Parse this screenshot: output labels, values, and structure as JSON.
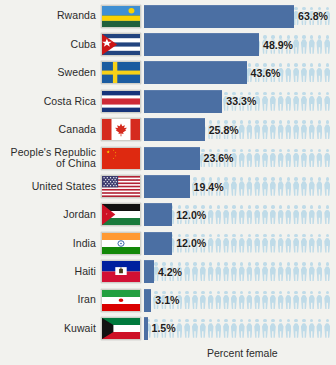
{
  "chart_data": {
    "type": "bar",
    "title": "",
    "xlabel": "Percent female",
    "ylabel": "",
    "orientation": "horizontal",
    "xlim": [
      0,
      63.8
    ],
    "grid": false,
    "legend": false,
    "categories": [
      "Rwanda",
      "Cuba",
      "Sweden",
      "Costa Rica",
      "Canada",
      "People's Republic of China",
      "United States",
      "Jordan",
      "India",
      "Haiti",
      "Iran",
      "Kuwait"
    ],
    "values": [
      63.8,
      48.9,
      43.6,
      33.3,
      25.8,
      23.6,
      19.4,
      12.0,
      12.0,
      4.2,
      3.1,
      1.5
    ],
    "value_labels": [
      "63.8%",
      "48.9%",
      "43.6%",
      "33.3%",
      "25.8%",
      "23.6%",
      "19.4%",
      "12.0%",
      "12.0%",
      "4.2%",
      "3.1%",
      "1.5%"
    ],
    "bar_color": "#4b6fa3",
    "background_icon_color": "#bfdbe8"
  },
  "axis": {
    "caption": "Percent female"
  },
  "rows": [
    {
      "country": "Rwanda",
      "value_label": "63.8%",
      "flag": "rwanda-flag",
      "lines": [
        "Rwanda"
      ]
    },
    {
      "country": "Cuba",
      "value_label": "48.9%",
      "flag": "cuba-flag",
      "lines": [
        "Cuba"
      ]
    },
    {
      "country": "Sweden",
      "value_label": "43.6%",
      "flag": "sweden-flag",
      "lines": [
        "Sweden"
      ]
    },
    {
      "country": "Costa Rica",
      "value_label": "33.3%",
      "flag": "costa-rica-flag",
      "lines": [
        "Costa Rica"
      ]
    },
    {
      "country": "Canada",
      "value_label": "25.8%",
      "flag": "canada-flag",
      "lines": [
        "Canada"
      ]
    },
    {
      "country": "People's Republic of China",
      "value_label": "23.6%",
      "flag": "china-flag",
      "lines": [
        "People's Republic",
        "of China"
      ]
    },
    {
      "country": "United States",
      "value_label": "19.4%",
      "flag": "united-states-flag",
      "lines": [
        "United States"
      ]
    },
    {
      "country": "Jordan",
      "value_label": "12.0%",
      "flag": "jordan-flag",
      "lines": [
        "Jordan"
      ]
    },
    {
      "country": "India",
      "value_label": "12.0%",
      "flag": "india-flag",
      "lines": [
        "India"
      ]
    },
    {
      "country": "Haiti",
      "value_label": "4.2%",
      "flag": "haiti-flag",
      "lines": [
        "Haiti"
      ]
    },
    {
      "country": "Iran",
      "value_label": "3.1%",
      "flag": "iran-flag",
      "lines": [
        "Iran"
      ]
    },
    {
      "country": "Kuwait",
      "value_label": "1.5%",
      "flag": "kuwait-flag",
      "lines": [
        "Kuwait"
      ]
    }
  ],
  "colors": {
    "bar": "#4b6fa3",
    "person_icon": "#bfdbe8",
    "background": "#f2f2ee",
    "text": "#2b2b2b"
  }
}
